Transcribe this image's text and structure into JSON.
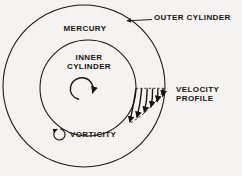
{
  "figure": {
    "kind": "schematic-diagram",
    "background_color": "#f4f3f1",
    "ink_color": "#16140f"
  },
  "labels": {
    "mercury": "MERCURY",
    "inner_cylinder_line1": "INNER",
    "inner_cylinder_line2": "CYLINDER",
    "outer_cylinder": "OUTER CYLINDER",
    "velocity_profile_line1": "VELOCITY",
    "velocity_profile_line2": "PROFILE",
    "vorticity": "VORTICITY"
  },
  "icons": {
    "rotation_spiral": "counterclockwise-spiral-arrow",
    "vorticity_marker": "circular-arrow",
    "outer_leader": "leader-line-with-arrowhead",
    "velocity_vectors": "downward-arrow-array",
    "profile_envelope": "dashed-curve"
  },
  "geometry": {
    "outer_circle": {
      "cx": 84,
      "cy": 86,
      "r": 81
    },
    "inner_circle": {
      "cx": 88,
      "cy": 88,
      "r": 48
    },
    "vorticity_circle": {
      "cx": 59,
      "cy": 134,
      "r": 5.5
    },
    "velocity_baseline_y": 88,
    "velocity_arrow_count": 6
  }
}
